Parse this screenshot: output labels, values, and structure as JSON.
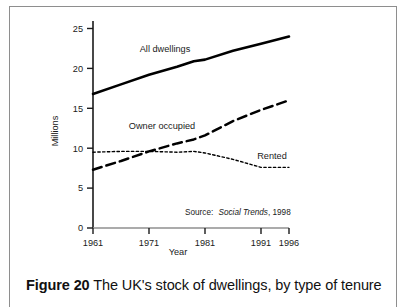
{
  "figure": {
    "caption_number": "Figure 20",
    "caption_text": "The UK's stock of dwellings, by type of tenure"
  },
  "chart_data": {
    "type": "line",
    "title": "",
    "xlabel": "Year",
    "ylabel": "Millions",
    "xlim": [
      1961,
      1996
    ],
    "ylim": [
      0,
      25
    ],
    "xticks": [
      1961,
      1971,
      1981,
      1991,
      1996
    ],
    "xtick_labels": [
      "1961",
      "1971",
      "1981",
      "1991",
      "1996"
    ],
    "yticks": [
      0,
      5,
      10,
      15,
      20,
      25
    ],
    "ytick_labels": [
      "0",
      "5",
      "10",
      "15",
      "20",
      "25"
    ],
    "grid": false,
    "legend_position": "inline-labels",
    "annotations": {
      "source_prefix": "Source:",
      "source_italic": "Social Trends",
      "source_suffix": ", 1998"
    },
    "x": [
      1961,
      1966,
      1971,
      1976,
      1979,
      1981,
      1986,
      1991,
      1996
    ],
    "series": [
      {
        "name": "All dwellings",
        "style": "solid",
        "color": "#000000",
        "values": [
          16.8,
          18.0,
          19.2,
          20.2,
          20.9,
          21.1,
          22.2,
          23.1,
          24.0
        ]
      },
      {
        "name": "Owner occupied",
        "style": "dashed",
        "color": "#000000",
        "values": [
          7.3,
          8.4,
          9.6,
          10.6,
          11.1,
          11.6,
          13.4,
          14.8,
          16.0
        ]
      },
      {
        "name": "Rented",
        "style": "dotted",
        "color": "#000000",
        "values": [
          9.5,
          9.6,
          9.6,
          9.5,
          9.6,
          9.4,
          8.6,
          7.6,
          7.6
        ]
      }
    ]
  }
}
